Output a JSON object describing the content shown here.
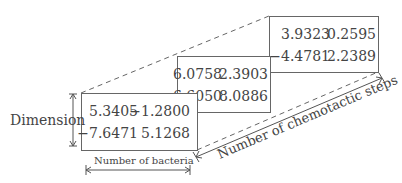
{
  "labels": {
    "dimension": "Dimension",
    "bacteria": "Number of bacteria",
    "steps": "Number of chemotactic steps"
  },
  "matrices": [
    {
      "name": "front",
      "values": [
        [
          "5.3405",
          "−1.2800"
        ],
        [
          "−7.6471",
          "5.1268"
        ]
      ]
    },
    {
      "name": "middle",
      "values": [
        [
          "6.0758",
          "2.3903"
        ],
        [
          "−6.6050",
          "8.0886"
        ]
      ]
    },
    {
      "name": "back",
      "values": [
        [
          "3.9323",
          "0.2595"
        ],
        [
          "−4.4781",
          "2.2389"
        ]
      ]
    }
  ]
}
